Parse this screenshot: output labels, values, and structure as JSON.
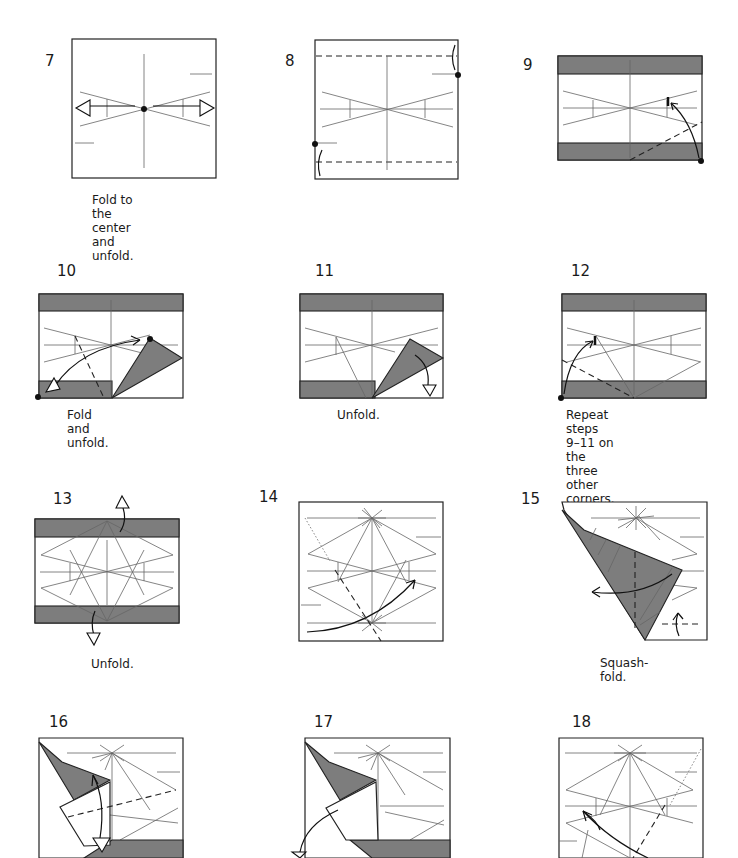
{
  "page": {
    "type": "origami diagram sequence",
    "colors": {
      "paper": "#ffffff",
      "colored_side": "#7d7d7d",
      "line": "#222222",
      "crease": "#666666"
    }
  },
  "steps": [
    {
      "number": "7",
      "caption": "Fold to the center\nand unfold."
    },
    {
      "number": "8",
      "caption": ""
    },
    {
      "number": "9",
      "caption": ""
    },
    {
      "number": "10",
      "caption": "Fold and unfold."
    },
    {
      "number": "11",
      "caption": "Unfold."
    },
    {
      "number": "12",
      "caption": "Repeat steps 9–11 on\nthe three other corners."
    },
    {
      "number": "13",
      "caption": "Unfold."
    },
    {
      "number": "14",
      "caption": ""
    },
    {
      "number": "15",
      "caption": "Squash-fold."
    },
    {
      "number": "16",
      "caption": ""
    },
    {
      "number": "17",
      "caption": ""
    },
    {
      "number": "18",
      "caption": ""
    }
  ]
}
